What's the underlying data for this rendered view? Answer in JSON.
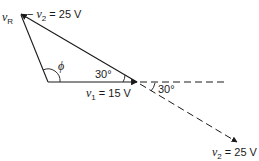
{
  "diagram": {
    "type": "phasor-diagram",
    "labels": {
      "vR": {
        "symbol": "v",
        "subscript": "R"
      },
      "neg_v2": {
        "prefix": "− ",
        "symbol": "v",
        "subscript": "2",
        "value": " = 25 V"
      },
      "v1": {
        "symbol": "v",
        "subscript": "1",
        "value": " = 15 V"
      },
      "v2": {
        "symbol": "v",
        "subscript": "2",
        "value": " = 25 V"
      },
      "phi": "ϕ",
      "angle_inner": "30°",
      "angle_outer": "30°"
    },
    "colors": {
      "line": "#1a1a1a",
      "background": "#ffffff"
    }
  }
}
